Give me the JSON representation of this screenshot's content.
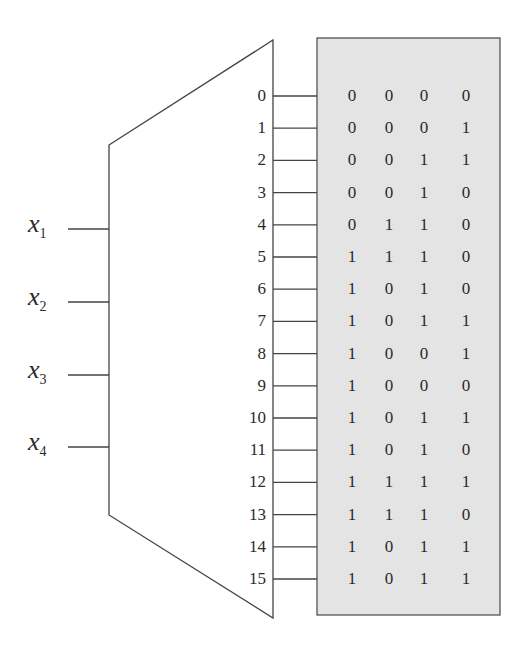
{
  "decoder": {
    "inputs": [
      {
        "var": "x",
        "sub": "1"
      },
      {
        "var": "x",
        "sub": "2"
      },
      {
        "var": "x",
        "sub": "3"
      },
      {
        "var": "x",
        "sub": "4"
      }
    ],
    "outputs": [
      "0",
      "1",
      "2",
      "3",
      "4",
      "5",
      "6",
      "7",
      "8",
      "9",
      "10",
      "11",
      "12",
      "13",
      "14",
      "15"
    ]
  },
  "table": {
    "fill_color": "#e4e4e4",
    "rows": [
      [
        "0",
        "0",
        "0",
        "0"
      ],
      [
        "0",
        "0",
        "0",
        "1"
      ],
      [
        "0",
        "0",
        "1",
        "1"
      ],
      [
        "0",
        "0",
        "1",
        "0"
      ],
      [
        "0",
        "1",
        "1",
        "0"
      ],
      [
        "1",
        "1",
        "1",
        "0"
      ],
      [
        "1",
        "0",
        "1",
        "0"
      ],
      [
        "1",
        "0",
        "1",
        "1"
      ],
      [
        "1",
        "0",
        "0",
        "1"
      ],
      [
        "1",
        "0",
        "0",
        "0"
      ],
      [
        "1",
        "0",
        "1",
        "1"
      ],
      [
        "1",
        "0",
        "1",
        "0"
      ],
      [
        "1",
        "1",
        "1",
        "1"
      ],
      [
        "1",
        "1",
        "1",
        "0"
      ],
      [
        "1",
        "0",
        "1",
        "1"
      ],
      [
        "1",
        "0",
        "1",
        "1"
      ]
    ]
  }
}
